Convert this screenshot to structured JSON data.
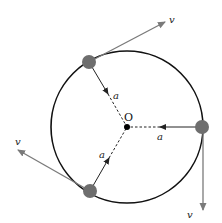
{
  "diagram": {
    "center_label": "O",
    "colors": {
      "circle": "#111111",
      "ball": "#6e6e6e",
      "velocity": "#7a7a7a",
      "acceleration": "#222222",
      "center": "#000000"
    },
    "circle": {
      "cx": 127,
      "cy": 127,
      "r": 76
    },
    "particles": [
      {
        "id": "top-left",
        "position": [
          89,
          62
        ],
        "velocity_label": "v",
        "velocity_tip": [
          165,
          22
        ],
        "velocity_label_pos": [
          169,
          22
        ],
        "acceleration_label": "a",
        "acceleration_label_pos": [
          114,
          98
        ]
      },
      {
        "id": "right",
        "position": [
          202,
          127
        ],
        "velocity_label": "v",
        "velocity_tip": [
          203,
          210
        ],
        "velocity_label_pos": [
          188,
          217
        ],
        "acceleration_label": "a",
        "acceleration_label_pos": [
          158,
          139
        ]
      },
      {
        "id": "bottom-left",
        "position": [
          90,
          191
        ],
        "velocity_label": "v",
        "velocity_tip": [
          18,
          150
        ],
        "velocity_label_pos": [
          16,
          145
        ],
        "acceleration_label": "a",
        "acceleration_label_pos": [
          100,
          158
        ]
      }
    ]
  }
}
